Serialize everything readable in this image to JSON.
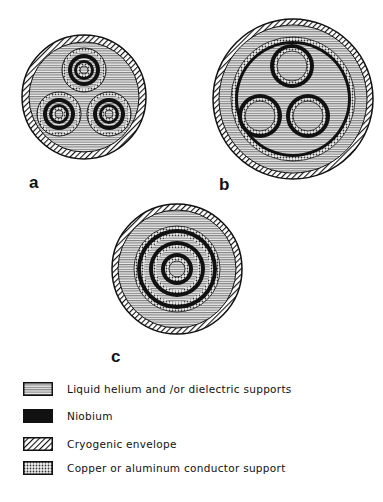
{
  "figure": {
    "panels": [
      {
        "id": "a",
        "label": "a",
        "description": "three-phase cable with three coaxial conductors in shared helium enclosure"
      },
      {
        "id": "b",
        "label": "b",
        "description": "three-phase cable with three single conductors inside niobium return shield"
      },
      {
        "id": "c",
        "label": "c",
        "description": "single coaxial multi-layer conductor"
      }
    ],
    "legend": [
      {
        "pattern": "horizontal-lines",
        "label": "Liquid helium and /or dielectric supports"
      },
      {
        "pattern": "solid-black",
        "label": "Niobium"
      },
      {
        "pattern": "diagonal-hatch",
        "label": "Cryogenic envelope"
      },
      {
        "pattern": "crosshatch-dots",
        "label": "Copper or aluminum conductor support"
      }
    ]
  },
  "colors": {
    "ink": "#111111",
    "helium": "#d8d8d8",
    "background": "#ffffff"
  }
}
